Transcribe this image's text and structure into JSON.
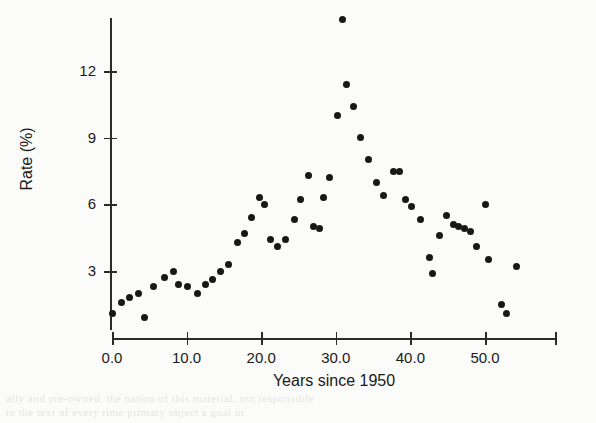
{
  "chart_data": {
    "type": "scatter",
    "title": "",
    "xlabel": "Years since 1950",
    "ylabel": "Rate (%)",
    "xlim": [
      -1.5,
      59.5
    ],
    "ylim": [
      0.1,
      14.5
    ],
    "xticks": [
      0.0,
      10.0,
      20.0,
      30.0,
      40.0,
      50.0
    ],
    "xticklabels": [
      "0.0",
      "10.0",
      "20.0",
      "30.0",
      "40.0",
      "50.0"
    ],
    "yticks": [
      3,
      6,
      9,
      12
    ],
    "yticklabels": [
      "3",
      "6",
      "9",
      "12"
    ],
    "grid": false,
    "legend": null,
    "marker": "filled-circle",
    "marker_color": "#181818",
    "axis_color": "#2b2b2b",
    "points": [
      {
        "x": 0.0,
        "y": 1.1
      },
      {
        "x": 1.3,
        "y": 1.6
      },
      {
        "x": 2.4,
        "y": 1.8
      },
      {
        "x": 3.5,
        "y": 2.0
      },
      {
        "x": 4.3,
        "y": 0.9
      },
      {
        "x": 5.6,
        "y": 2.3
      },
      {
        "x": 7.0,
        "y": 2.7
      },
      {
        "x": 8.2,
        "y": 3.0
      },
      {
        "x": 8.9,
        "y": 2.4
      },
      {
        "x": 10.1,
        "y": 2.3
      },
      {
        "x": 11.4,
        "y": 2.0
      },
      {
        "x": 12.5,
        "y": 2.4
      },
      {
        "x": 13.5,
        "y": 2.6
      },
      {
        "x": 14.6,
        "y": 3.0
      },
      {
        "x": 15.6,
        "y": 3.3
      },
      {
        "x": 16.8,
        "y": 4.3
      },
      {
        "x": 17.7,
        "y": 4.7
      },
      {
        "x": 18.7,
        "y": 5.4
      },
      {
        "x": 19.8,
        "y": 6.3
      },
      {
        "x": 20.4,
        "y": 6.0
      },
      {
        "x": 21.3,
        "y": 4.4
      },
      {
        "x": 22.2,
        "y": 4.1
      },
      {
        "x": 23.3,
        "y": 4.4
      },
      {
        "x": 24.4,
        "y": 5.3
      },
      {
        "x": 25.3,
        "y": 6.2
      },
      {
        "x": 26.3,
        "y": 7.3
      },
      {
        "x": 27.0,
        "y": 5.0
      },
      {
        "x": 27.8,
        "y": 4.9
      },
      {
        "x": 28.4,
        "y": 6.3
      },
      {
        "x": 29.1,
        "y": 7.2
      },
      {
        "x": 30.2,
        "y": 10.0
      },
      {
        "x": 30.9,
        "y": 14.3
      },
      {
        "x": 31.5,
        "y": 11.4
      },
      {
        "x": 32.4,
        "y": 10.4
      },
      {
        "x": 33.3,
        "y": 9.0
      },
      {
        "x": 34.4,
        "y": 8.0
      },
      {
        "x": 35.5,
        "y": 7.0
      },
      {
        "x": 36.4,
        "y": 6.4
      },
      {
        "x": 37.7,
        "y": 7.5
      },
      {
        "x": 38.6,
        "y": 7.5
      },
      {
        "x": 39.4,
        "y": 6.2
      },
      {
        "x": 40.2,
        "y": 5.9
      },
      {
        "x": 41.3,
        "y": 5.3
      },
      {
        "x": 42.5,
        "y": 3.6
      },
      {
        "x": 42.9,
        "y": 2.9
      },
      {
        "x": 43.9,
        "y": 4.6
      },
      {
        "x": 44.9,
        "y": 5.5
      },
      {
        "x": 45.8,
        "y": 5.1
      },
      {
        "x": 46.5,
        "y": 5.0
      },
      {
        "x": 47.3,
        "y": 4.9
      },
      {
        "x": 48.1,
        "y": 4.8
      },
      {
        "x": 48.8,
        "y": 4.1
      },
      {
        "x": 50.0,
        "y": 6.0
      },
      {
        "x": 50.5,
        "y": 3.5
      },
      {
        "x": 52.2,
        "y": 1.5
      },
      {
        "x": 52.9,
        "y": 1.1
      },
      {
        "x": 54.2,
        "y": 3.2
      }
    ]
  },
  "ghost_text": {
    "line1": "ally and pre-owned, the nation of this material, not responsible",
    "line2": "to the text of every time primary object a goal in",
    "line3": "10.0        20.0        30.0"
  }
}
